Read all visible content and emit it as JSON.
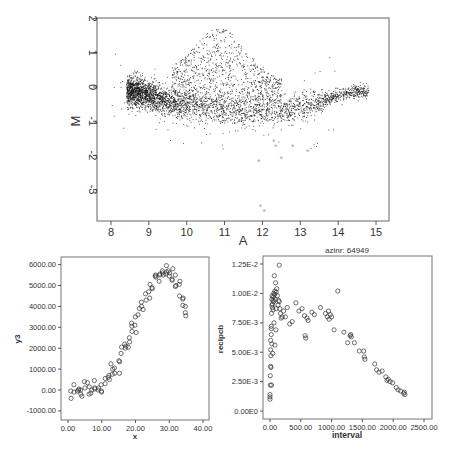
{
  "chart_data": [
    {
      "type": "scatter",
      "title": "",
      "xlabel": "A",
      "ylabel": "M",
      "xlim": [
        7.6,
        15.3
      ],
      "ylim": [
        -3.9,
        2
      ],
      "xticks": [
        "8",
        "9",
        "10",
        "11",
        "12",
        "13",
        "14",
        "15"
      ],
      "yticks": [
        "2",
        "1",
        "0",
        "-1",
        "-2",
        "-3"
      ],
      "grid": false,
      "description": "MA plot: dense cloud of several thousand small black points; main band starts near M=0 at A≈8.5, dips to about M=-0.7 at A≈11-13, rises back to M≈-0.1 at A≈14.5; an upper plume reaching M≈1.7 around A≈10.5-11.5; a few highlighted gray star outliers below.",
      "series": [
        {
          "name": "band_trend",
          "x": [
            8.4,
            8.8,
            9.2,
            9.6,
            10.0,
            10.5,
            11.0,
            11.5,
            12.0,
            12.5,
            13.0,
            13.3,
            13.7,
            14.0,
            14.4,
            14.8
          ],
          "y": [
            -0.1,
            -0.15,
            -0.3,
            -0.45,
            -0.55,
            -0.62,
            -0.68,
            -0.72,
            -0.72,
            -0.68,
            -0.6,
            -0.5,
            -0.35,
            -0.22,
            -0.12,
            -0.1
          ]
        },
        {
          "name": "highlighted_outliers",
          "color": "#aaaaaa",
          "marker": "star",
          "x": [
            11.9,
            12.3,
            12.35,
            12.5,
            12.8,
            13.2,
            11.95,
            12.05
          ],
          "y": [
            -2.2,
            -1.6,
            -1.75,
            -2.1,
            -1.75,
            -1.9,
            -3.5,
            -3.65
          ]
        }
      ]
    },
    {
      "type": "scatter",
      "title": "",
      "xlabel": "x",
      "ylabel": "y3",
      "xlim": [
        -2,
        42
      ],
      "ylim": [
        -1400,
        6400
      ],
      "xticks": [
        "0.00",
        "10.00",
        "20.00",
        "30.00",
        "40.00"
      ],
      "yticks": [
        "6000.00",
        "5000.00",
        "4000.00",
        "3000.00",
        "2000.00",
        "1000.00",
        "0.00",
        "-1000.00"
      ],
      "grid": false,
      "marker": "open-circle",
      "series": [
        {
          "name": "y3",
          "x": [
            1,
            1,
            2,
            2,
            3,
            3,
            3,
            4,
            4,
            4,
            5,
            5,
            6,
            6,
            6,
            7,
            7,
            8,
            8,
            8,
            9,
            9,
            10,
            10,
            10,
            11,
            11,
            12,
            12,
            12,
            13,
            13,
            13,
            14,
            14,
            15,
            15,
            15,
            16,
            16,
            17,
            17,
            17,
            18,
            18,
            18,
            19,
            19,
            19,
            20,
            20,
            20,
            21,
            21,
            22,
            22,
            22,
            23,
            23,
            24,
            24,
            24,
            25,
            25,
            26,
            26,
            26,
            27,
            27,
            27,
            28,
            28,
            28,
            29,
            29,
            29,
            30,
            30,
            30,
            31,
            31,
            31,
            32,
            32,
            32,
            33,
            33,
            33,
            34,
            34,
            34,
            35,
            35,
            35
          ],
          "y": [
            -400,
            -50,
            250,
            -100,
            0,
            50,
            -50,
            -300,
            -200,
            0,
            100,
            400,
            -200,
            350,
            150,
            -150,
            0,
            100,
            50,
            450,
            100,
            0,
            -100,
            250,
            -50,
            300,
            550,
            700,
            600,
            500,
            1250,
            1000,
            750,
            800,
            1050,
            1350,
            1400,
            800,
            1750,
            2050,
            2100,
            2200,
            2000,
            2300,
            2500,
            2050,
            2800,
            3050,
            3200,
            2750,
            3500,
            3100,
            3600,
            3900,
            3850,
            4200,
            4000,
            4300,
            4600,
            4700,
            4400,
            5050,
            4850,
            4900,
            5400,
            5500,
            5450,
            5550,
            5200,
            5500,
            5600,
            5500,
            5700,
            5950,
            5650,
            5550,
            5700,
            5450,
            5600,
            5800,
            5300,
            5250,
            5500,
            5000,
            4950,
            5200,
            4500,
            5050,
            4400,
            4350,
            4050,
            3700,
            3550,
            4000
          ]
        }
      ]
    },
    {
      "type": "scatter",
      "title": "azinr: 64949",
      "xlabel": "interval",
      "ylabel": "recipcb",
      "xlim": [
        -120,
        2600
      ],
      "ylim": [
        -0.0006,
        0.0136
      ],
      "xticks": [
        "0.00",
        "500.00",
        "1000.00",
        "1500.00",
        "2000.00",
        "2500.00"
      ],
      "yticks": [
        "1.25E-2",
        "1.00E-2",
        "7.50E-3",
        "5.00E-3",
        "2.50E-3",
        "0.00E0"
      ],
      "grid": false,
      "marker": "open-circle",
      "series": [
        {
          "name": "recipcb",
          "x": [
            0,
            0,
            0,
            5,
            5,
            10,
            10,
            10,
            15,
            15,
            20,
            20,
            20,
            25,
            25,
            30,
            30,
            30,
            35,
            40,
            40,
            45,
            50,
            50,
            55,
            60,
            60,
            65,
            70,
            75,
            80,
            80,
            85,
            90,
            95,
            100,
            100,
            110,
            120,
            130,
            140,
            150,
            150,
            160,
            170,
            180,
            200,
            220,
            250,
            280,
            320,
            360,
            420,
            470,
            520,
            560,
            570,
            580,
            600,
            620,
            680,
            720,
            820,
            900,
            930,
            950,
            960,
            980,
            1000,
            1040,
            1100,
            1200,
            1260,
            1300,
            1310,
            1320,
            1370,
            1450,
            1520,
            1530,
            1540,
            1700,
            1730,
            1770,
            1820,
            1880,
            1900,
            1920,
            1950,
            1990,
            2050,
            2080,
            2120,
            2170,
            2180,
            2190
          ],
          "y": [
            0.001,
            0.0012,
            0.0014,
            0.003,
            0.0022,
            0.0038,
            0.0052,
            0.006,
            0.0037,
            0.0047,
            0.0065,
            0.007,
            0.0072,
            0.0083,
            0.0022,
            0.0095,
            0.009,
            0.0057,
            0.0098,
            0.0088,
            0.0091,
            0.0049,
            0.0086,
            0.0094,
            0.0097,
            0.0093,
            0.01,
            0.0075,
            0.0115,
            0.0099,
            0.0102,
            0.0056,
            0.0095,
            0.0109,
            0.0069,
            0.0101,
            0.0087,
            0.0104,
            0.0098,
            0.009,
            0.0094,
            0.0093,
            0.0124,
            0.0087,
            0.0083,
            0.0079,
            0.008,
            0.0085,
            0.008,
            0.0088,
            0.0074,
            0.0076,
            0.0092,
            0.0085,
            0.0087,
            0.0081,
            0.0064,
            0.0062,
            0.0079,
            0.0077,
            0.0084,
            0.0082,
            0.0088,
            0.0083,
            0.008,
            0.0085,
            0.0078,
            0.0082,
            0.008,
            0.0069,
            0.0102,
            0.0067,
            0.0058,
            0.0064,
            0.0065,
            0.0063,
            0.0058,
            0.0051,
            0.0051,
            0.0046,
            0.0044,
            0.004,
            0.0035,
            0.0033,
            0.0034,
            0.0029,
            0.0026,
            0.0027,
            0.0025,
            0.0024,
            0.002,
            0.0018,
            0.0017,
            0.0015,
            0.0016,
            0.0014
          ]
        }
      ]
    }
  ],
  "plots": {
    "top": {
      "xlabel": "A",
      "ylabel": "M",
      "xticks": [
        "8",
        "9",
        "10",
        "11",
        "12",
        "13",
        "14",
        "15"
      ],
      "yticks": [
        "2",
        "1",
        "0",
        "-1",
        "-2",
        "-3"
      ]
    },
    "bottom_left": {
      "xlabel": "x",
      "ylabel": "y3",
      "xticks": [
        "0.00",
        "10.00",
        "20.00",
        "30.00",
        "40.00"
      ],
      "yticks": [
        "6000.00",
        "5000.00",
        "4000.00",
        "3000.00",
        "2000.00",
        "1000.00",
        "0.00",
        "-1000.00"
      ]
    },
    "bottom_right": {
      "title": "azinr: 64949",
      "xlabel": "interval",
      "ylabel": "recipcb",
      "xticks": [
        "0.00",
        "500.00",
        "1000.00",
        "1500.00",
        "2000.00",
        "2500.00"
      ],
      "yticks": [
        "1.25E-2",
        "1.00E-2",
        "7.50E-3",
        "5.00E-3",
        "2.50E-3",
        "0.00E0"
      ]
    }
  },
  "colors": {
    "points": "#222222",
    "outliers": "#aaaaaa",
    "frame": "#555555"
  }
}
